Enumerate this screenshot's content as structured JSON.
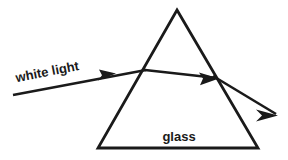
{
  "figure": {
    "name": "light-refraction-through-glass-prism",
    "background_color": "#ffffff",
    "stroke_color": "#1a1a1a",
    "width": 288,
    "height": 160
  },
  "prism": {
    "label": "glass",
    "label_x": 179,
    "label_y": 141,
    "label_font_size": 13,
    "stroke_width": 2.8,
    "apex": {
      "x": 177,
      "y": 10
    },
    "bottom_left": {
      "x": 98,
      "y": 148
    },
    "bottom_right": {
      "x": 258,
      "y": 148
    },
    "points": "177,10 258,148 98,148"
  },
  "rays": {
    "incoming": {
      "label": "white light",
      "label_x": 48,
      "label_y": 76,
      "label_rotation": -11,
      "label_font_size": 13,
      "start_x": 13,
      "start_y": 95,
      "end_x": 146,
      "end_y": 70,
      "stroke_width": 2.6,
      "arrow_points": "116,73.6 99,69.5 102,75.2 98,80.5"
    },
    "internal": {
      "start_x": 145,
      "start_y": 70,
      "end_x": 217,
      "end_y": 78,
      "stroke_width": 2.6,
      "arrow_points": "219,78.4 199,72.5 203,78.6 200,85.2"
    },
    "exit": {
      "start_x": 213,
      "start_y": 76,
      "end_x": 276,
      "end_y": 114,
      "stroke_width": 2.6,
      "arrow_points": "278,115.5 256,109.5 262,115.5 256,121.5"
    }
  }
}
